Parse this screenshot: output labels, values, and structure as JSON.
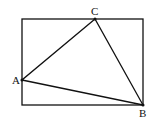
{
  "diagram": {
    "rectangle": {
      "x1": 22,
      "y1": 19,
      "x2": 143,
      "y2": 105
    },
    "points": {
      "A": {
        "label": "A",
        "x": 22,
        "y": 80,
        "lx": 12,
        "ly": 84
      },
      "B": {
        "label": "B",
        "x": 143,
        "y": 105,
        "lx": 139,
        "ly": 117
      },
      "C": {
        "label": "C",
        "x": 95,
        "y": 19,
        "lx": 91,
        "ly": 15
      }
    },
    "triangle": [
      "A",
      "B",
      "C"
    ],
    "stroke_color": "#111111"
  }
}
